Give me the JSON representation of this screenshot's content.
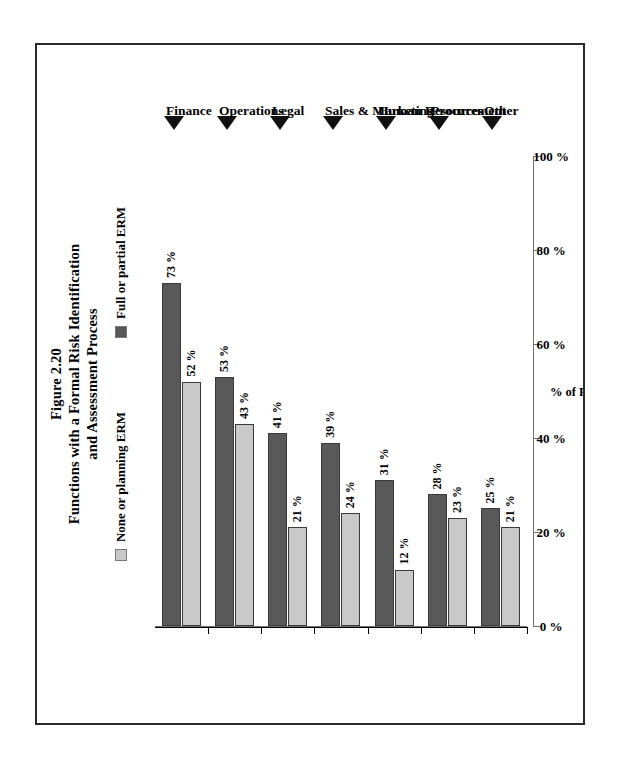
{
  "figure": {
    "number": "Figure 2.20",
    "title_line1": "Functions with a Formal Risk Identification",
    "title_line2": "and Assessment Process"
  },
  "legend": {
    "items": [
      {
        "label": "None or planning ERM",
        "color": "#c9c9c9",
        "key": "none_or_planning"
      },
      {
        "label": "Full or partial ERM",
        "color": "#595959",
        "key": "full_or_partial"
      }
    ]
  },
  "axis": {
    "title": "% of Respondents",
    "ticks": [
      "0 %",
      "20 %",
      "40 %",
      "60 %",
      "80 %",
      "100 %"
    ],
    "min": 0,
    "max": 100
  },
  "chart_data": {
    "type": "bar",
    "orientation": "horizontal",
    "title": "Figure 2.20 Functions with a Formal Risk Identification and Assessment Process",
    "xlabel": "% of Respondents",
    "ylabel": "",
    "xlim": [
      0,
      100
    ],
    "grid": false,
    "legend_position": "top",
    "categories": [
      "Finance",
      "Operations",
      "Legal",
      "Sales & Marketing",
      "Human Resources",
      "Procurement",
      "Other"
    ],
    "series": [
      {
        "name": "Full or partial ERM",
        "color": "#595959",
        "values": [
          73,
          53,
          41,
          39,
          31,
          28,
          25
        ],
        "labels": [
          "73 %",
          "53 %",
          "41 %",
          "39 %",
          "31 %",
          "28 %",
          "25 %"
        ]
      },
      {
        "name": "None or planning ERM",
        "color": "#c9c9c9",
        "values": [
          52,
          43,
          21,
          24,
          12,
          23,
          21
        ],
        "labels": [
          "52 %",
          "43 %",
          "21 %",
          "24 %",
          "12 %",
          "23 %",
          "21 %"
        ]
      }
    ]
  }
}
